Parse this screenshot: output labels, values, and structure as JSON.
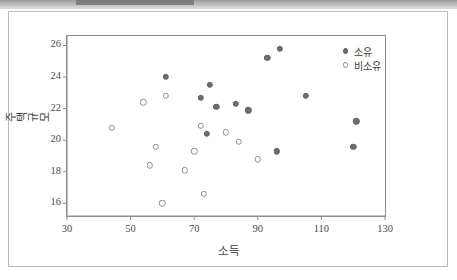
{
  "window": {
    "top_strip_present": true
  },
  "chart_data": {
    "type": "scatter",
    "title": "",
    "xlabel": "소득",
    "ylabel": "주택규모",
    "xlim": [
      30,
      130
    ],
    "ylim": [
      15.2,
      26.6
    ],
    "xticks": [
      30,
      50,
      70,
      90,
      110,
      130
    ],
    "yticks": [
      16,
      18,
      20,
      22,
      24,
      26
    ],
    "grid": false,
    "legend_position": "top-right",
    "series": [
      {
        "name": "소유",
        "marker": "filled-circle",
        "color": "#6e6e6e",
        "points": [
          [
            61,
            24.0
          ],
          [
            72,
            22.7
          ],
          [
            74,
            20.4
          ],
          [
            75,
            23.5
          ],
          [
            77,
            22.1
          ],
          [
            83,
            22.3
          ],
          [
            87,
            21.9
          ],
          [
            93,
            25.2
          ],
          [
            96,
            19.3
          ],
          [
            97,
            25.8
          ],
          [
            105,
            22.8
          ],
          [
            120,
            19.6
          ],
          [
            121,
            21.2
          ]
        ]
      },
      {
        "name": "비소유",
        "marker": "open-circle",
        "color": "#8f8f8f",
        "points": [
          [
            44,
            20.8
          ],
          [
            54,
            22.4
          ],
          [
            56,
            18.4
          ],
          [
            58,
            19.6
          ],
          [
            60,
            16.0
          ],
          [
            61,
            22.8
          ],
          [
            67,
            18.1
          ],
          [
            70,
            19.3
          ],
          [
            72,
            20.9
          ],
          [
            73,
            16.6
          ],
          [
            80,
            20.5
          ],
          [
            84,
            19.9
          ],
          [
            90,
            18.8
          ]
        ]
      }
    ]
  }
}
